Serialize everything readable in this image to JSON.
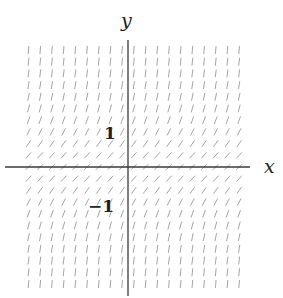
{
  "diagram": {
    "type": "slope-field",
    "equation": "dy/dx = 1 + y^2",
    "axes": {
      "x_label": "x",
      "y_label": "y",
      "tick_labels": {
        "pos": "1",
        "neg": "−1"
      }
    },
    "colors": {
      "axis": "#3a3a3a",
      "segment": "#9a9a9a",
      "text": "#222222"
    }
  },
  "chart_data": {
    "type": "slope-field",
    "title": "",
    "xlabel": "x",
    "ylabel": "y",
    "field": "dy/dx = 1 + y^2",
    "xlim": [
      -3.2,
      3.2
    ],
    "ylim": [
      -3.3,
      3.3
    ],
    "grid_step": 0.325,
    "annotated_ticks": {
      "y": [
        1,
        -1
      ]
    },
    "grid": false,
    "legend": null
  },
  "layout": {
    "origin_px": [
      128,
      167
    ],
    "unit_px": 36,
    "x_axis_px": [
      5,
      250
    ],
    "y_axis_px": [
      40,
      296
    ],
    "field_x_px": [
      12,
      245
    ],
    "field_y_px": [
      50,
      287
    ],
    "spacing_px": 11.7,
    "segment_len_px": 8
  }
}
